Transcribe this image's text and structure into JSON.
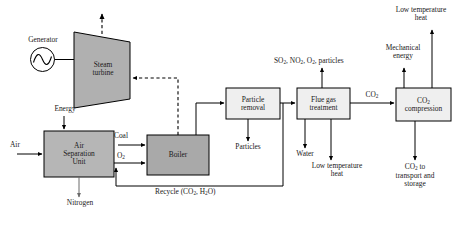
{
  "diagram": {
    "colors": {
      "line": "#000000",
      "text": "#1a1a1a",
      "turbine_fill": "#b0b0b0",
      "asu_fill": "#b6b6b6",
      "boiler_fill": "#a9a9a9",
      "light_box_fill": "#efefef",
      "generator_fill": "#ffffff",
      "background": "#ffffff"
    },
    "nodes": {
      "generator": {
        "label": "Generator",
        "icon": "sine-wave-generator-icon"
      },
      "steam_turbine": {
        "label_line1": "Steam",
        "label_line2": "turbine"
      },
      "air_separation_unit": {
        "label_line1": "Air",
        "label_line2": "Separation",
        "label_line3": "Unit"
      },
      "boiler": {
        "label": "Boiler"
      },
      "particle_removal": {
        "label_line1": "Particle",
        "label_line2": "removal"
      },
      "flue_gas_treatment": {
        "label_line1": "Flue gas",
        "label_line2": "treatment"
      },
      "co2_compression": {
        "label_line1": "CO",
        "label_line1_sub": "2",
        "label_line2": "compression"
      }
    },
    "streams": {
      "energy": "Energy",
      "air": "Air",
      "nitrogen": "Nitrogen",
      "coal": "Coal",
      "oxygen": "O",
      "oxygen_sub": "2",
      "recycle": "Recycle (CO₂, H₂O)",
      "recycle_plain": "Recycle (CO",
      "recycle_sub1": "2",
      "recycle_mid": ", H",
      "recycle_sub2": "2",
      "recycle_end": "O)",
      "particles": "Particles",
      "water": "Water",
      "low_temperature_heat_fgt_line1": "Low temperature",
      "low_temperature_heat_fgt_line2": "heat",
      "flue_emissions": "SO₂, NO₂, O₂, particles",
      "flue_emissions_parts": {
        "so": "SO",
        "so_sub": "2",
        "no": ", NO",
        "no_sub": "2",
        "o": ", O",
        "o_sub": "2",
        "tail": ", particles"
      },
      "co2_to_compression": "CO",
      "co2_to_compression_sub": "2",
      "mechanical_energy_line1": "Mechanical",
      "mechanical_energy_line2": "energy",
      "low_temperature_heat_comp_line1": "Low temperature",
      "low_temperature_heat_comp_line2": "heat",
      "co2_storage_line1": "CO",
      "co2_storage_line1_sub": "2",
      "co2_storage_line1_tail": " to",
      "co2_storage_line2": "transport and",
      "co2_storage_line3": "storage"
    }
  }
}
